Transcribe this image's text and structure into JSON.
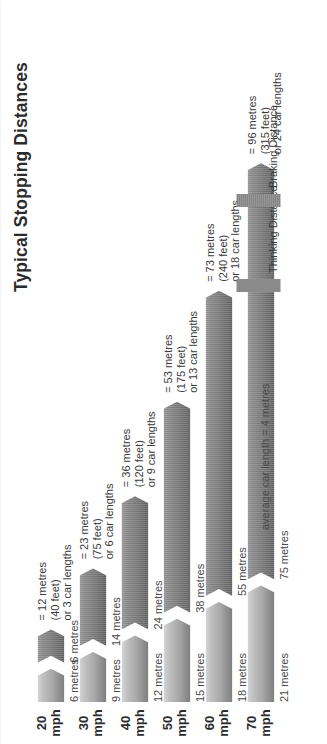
{
  "title": "Typical Stopping Distances",
  "note": "average car length = 4 metres",
  "legend": {
    "thinking": "Thinking Distance",
    "braking": "Braking Distance"
  },
  "chart_data": {
    "type": "bar",
    "title": "Typical Stopping Distances",
    "xlabel": "",
    "ylabel": "",
    "stacked": true,
    "orientation": "horizontal",
    "unit": "metres",
    "categories": [
      "20 mph",
      "30 mph",
      "40 mph",
      "50 mph",
      "60 mph",
      "70 mph"
    ],
    "series": [
      {
        "name": "Thinking Distance",
        "values": [
          6,
          9,
          12,
          15,
          18,
          21
        ]
      },
      {
        "name": "Braking Distance",
        "values": [
          6,
          14,
          24,
          38,
          55,
          75
        ]
      }
    ],
    "totals_metres": [
      12,
      23,
      36,
      53,
      73,
      96
    ],
    "totals_feet": [
      40,
      75,
      120,
      175,
      240,
      315
    ],
    "totals_car_lengths": [
      3,
      6,
      9,
      13,
      18,
      24
    ],
    "xlim": [
      0,
      96
    ],
    "grid": false,
    "legend_position": "bottom-right"
  },
  "rows": [
    {
      "speed_num": "20",
      "speed_unit": "mph",
      "thinking_label": "6 metres",
      "braking_label": "6 metres",
      "total_m": "= 12 metres",
      "total_ft": "(40 feet)",
      "total_cars": "or 3 car lengths"
    },
    {
      "speed_num": "30",
      "speed_unit": "mph",
      "thinking_label": "9 metres",
      "braking_label": "14 metres",
      "total_m": "= 23 metres",
      "total_ft": "(75 feet)",
      "total_cars": "or 6 car lengths"
    },
    {
      "speed_num": "40",
      "speed_unit": "mph",
      "thinking_label": "12 metres",
      "braking_label": "24 metres",
      "total_m": "= 36 metres",
      "total_ft": "(120 feet)",
      "total_cars": "or 9 car lengths"
    },
    {
      "speed_num": "50",
      "speed_unit": "mph",
      "thinking_label": "15 metres",
      "braking_label": "38 metres",
      "total_m": "= 53 metres",
      "total_ft": "(175 feet)",
      "total_cars": "or 13 car lengths"
    },
    {
      "speed_num": "60",
      "speed_unit": "mph",
      "thinking_label": "18 metres",
      "braking_label": "55 metres",
      "total_m": "= 73 metres",
      "total_ft": "(240 feet)",
      "total_cars": "or 18 car lengths"
    },
    {
      "speed_num": "70",
      "speed_unit": "mph",
      "thinking_label": "21 metres",
      "braking_label": "75 metres",
      "total_m": "= 96 metres",
      "total_ft": "(315 feet)",
      "total_cars": "or 24 car lengths"
    }
  ],
  "colors": {
    "thinking": "#a8a8a8",
    "braking": "#7b7b7b",
    "text": "#3a3a3a",
    "background": "#ffffff"
  }
}
